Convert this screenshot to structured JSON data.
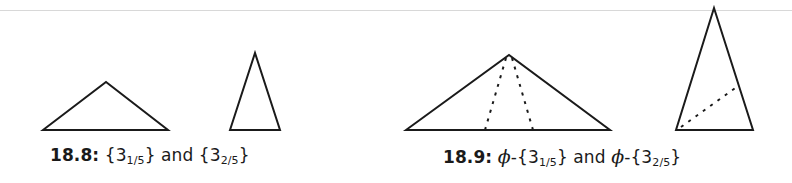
{
  "figures": [
    {
      "id": "18.8",
      "caption": {
        "number": "18.8:",
        "parts": [
          {
            "brace_open": "{",
            "base": "3",
            "sub": "1/5",
            "brace_close": "}"
          },
          {
            "conj": " and "
          },
          {
            "brace_open": "{",
            "base": "3",
            "sub": "2/5",
            "brace_close": "}"
          }
        ]
      },
      "shapes": [
        {
          "name": "obtuse-golden-triangle",
          "points": [
            [
              43,
              130
            ],
            [
              106,
              82
            ],
            [
              168,
              130
            ]
          ],
          "dashed": []
        },
        {
          "name": "acute-golden-triangle",
          "points": [
            [
              230,
              130
            ],
            [
              255,
              53
            ],
            [
              280,
              130
            ]
          ],
          "dashed": []
        }
      ]
    },
    {
      "id": "18.9",
      "caption": {
        "number": "18.9:",
        "phi": "ϕ",
        "dash": "-",
        "parts": [
          {
            "brace_open": "{",
            "base": "3",
            "sub": "1/5",
            "brace_close": "}"
          },
          {
            "conj": " and "
          },
          {
            "brace_open": "{",
            "base": "3",
            "sub": "2/5",
            "brace_close": "}"
          }
        ]
      },
      "shapes": [
        {
          "name": "phi-obtuse-triangle",
          "points": [
            [
              406,
              130
            ],
            [
              509,
              55
            ],
            [
              610,
              130
            ]
          ],
          "dashed": [
            [
              [
                506,
                58
              ],
              [
                485,
                130
              ]
            ],
            [
              [
                512,
                58
              ],
              [
                533,
                130
              ]
            ]
          ]
        },
        {
          "name": "phi-acute-triangle",
          "points": [
            [
              676,
              130
            ],
            [
              714,
              8
            ],
            [
              753,
              130
            ]
          ],
          "dashed": [
            [
              [
                681,
                127
              ],
              [
                738,
                86
              ]
            ]
          ]
        }
      ]
    }
  ],
  "style": {
    "stroke": "#1a1a1a",
    "rule": "#d8d8d8"
  }
}
